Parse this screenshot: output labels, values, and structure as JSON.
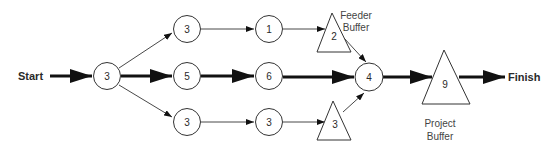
{
  "diagram": {
    "type": "critical-chain-network",
    "start_label": "Start",
    "finish_label": "Finish",
    "nodes": {
      "n_start": {
        "shape": "circle",
        "value": "3"
      },
      "n_top1": {
        "shape": "circle",
        "value": "3"
      },
      "n_top2": {
        "shape": "circle",
        "value": "1"
      },
      "n_feeder_top": {
        "shape": "triangle",
        "value": "2"
      },
      "n_mid1": {
        "shape": "circle",
        "value": "5"
      },
      "n_mid2": {
        "shape": "circle",
        "value": "6"
      },
      "n_merge": {
        "shape": "circle",
        "value": "4"
      },
      "n_project_buffer": {
        "shape": "triangle",
        "value": "9"
      },
      "n_bot1": {
        "shape": "circle",
        "value": "3"
      },
      "n_bot2": {
        "shape": "circle",
        "value": "3"
      },
      "n_feeder_bot": {
        "shape": "triangle",
        "value": "3"
      }
    },
    "annotations": {
      "feeder_buffer_line1": "Feeder",
      "feeder_buffer_line2": "Buffer",
      "project_buffer_line1": "Project",
      "project_buffer_line2": "Buffer"
    },
    "edges": [
      {
        "from": "Start",
        "to": "n_start",
        "style": "thick"
      },
      {
        "from": "n_start",
        "to": "n_top1",
        "style": "thin"
      },
      {
        "from": "n_start",
        "to": "n_mid1",
        "style": "thick"
      },
      {
        "from": "n_start",
        "to": "n_bot1",
        "style": "thin"
      },
      {
        "from": "n_top1",
        "to": "n_top2",
        "style": "thin"
      },
      {
        "from": "n_top2",
        "to": "n_feeder_top",
        "style": "thin"
      },
      {
        "from": "n_feeder_top",
        "to": "n_merge",
        "style": "thin"
      },
      {
        "from": "n_mid1",
        "to": "n_mid2",
        "style": "thick"
      },
      {
        "from": "n_mid2",
        "to": "n_merge",
        "style": "thick"
      },
      {
        "from": "n_bot1",
        "to": "n_bot2",
        "style": "thin"
      },
      {
        "from": "n_bot2",
        "to": "n_feeder_bot",
        "style": "thin"
      },
      {
        "from": "n_feeder_bot",
        "to": "n_merge",
        "style": "thin"
      },
      {
        "from": "n_merge",
        "to": "n_project_buffer",
        "style": "thick"
      },
      {
        "from": "n_project_buffer",
        "to": "Finish",
        "style": "thick"
      }
    ]
  }
}
